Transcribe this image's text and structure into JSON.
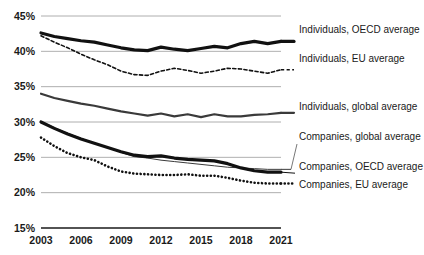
{
  "chart_data": {
    "type": "line",
    "title": "",
    "subtitle": "",
    "xlabel": "",
    "ylabel": "",
    "xlim": [
      2003,
      2021
    ],
    "ylim": [
      15,
      45
    ],
    "grid": true,
    "legend_position": "right",
    "y_ticks": [
      "45%",
      "40%",
      "35%",
      "30%",
      "25%",
      "20%",
      "15%"
    ],
    "y_tick_values": [
      45,
      40,
      35,
      30,
      25,
      20,
      15
    ],
    "x_ticks": [
      "2003",
      "2006",
      "2009",
      "2012",
      "2015",
      "2018",
      "2021"
    ],
    "x_tick_values": [
      2003,
      2006,
      2009,
      2012,
      2015,
      2018,
      2021
    ],
    "x": [
      2003,
      2004,
      2005,
      2006,
      2007,
      2008,
      2009,
      2010,
      2011,
      2012,
      2013,
      2014,
      2015,
      2016,
      2017,
      2018,
      2019,
      2020,
      2021
    ],
    "series": [
      {
        "name": "Individuals, OECD average",
        "style": "thick-solid",
        "color": "#111111",
        "width": 3.2,
        "values": [
          42.6,
          42.1,
          41.8,
          41.5,
          41.3,
          40.9,
          40.5,
          40.2,
          40.1,
          40.6,
          40.3,
          40.1,
          40.4,
          40.7,
          40.5,
          41.1,
          41.4,
          41.1,
          41.4
        ]
      },
      {
        "name": "Individuals, EU average",
        "style": "dashed",
        "color": "#111111",
        "width": 1.6,
        "values": [
          42.2,
          41.3,
          40.5,
          39.6,
          38.8,
          38.1,
          37.2,
          36.7,
          36.6,
          37.2,
          37.6,
          37.3,
          36.9,
          37.2,
          37.6,
          37.5,
          37.2,
          36.9,
          37.4
        ]
      },
      {
        "name": "Individuals, global average",
        "style": "medium-solid",
        "color": "#3a3a3a",
        "width": 2.2,
        "values": [
          34.0,
          33.4,
          33.0,
          32.6,
          32.3,
          31.9,
          31.5,
          31.2,
          30.9,
          31.2,
          30.8,
          31.1,
          30.7,
          31.1,
          30.8,
          30.8,
          31.0,
          31.1,
          31.3
        ]
      },
      {
        "name": "Companies, global average",
        "style": "thin-solid",
        "color": "#3a3a3a",
        "width": 1.0,
        "values": [
          30.1,
          29.2,
          28.4,
          27.7,
          27.0,
          26.4,
          25.7,
          25.1,
          24.9,
          24.6,
          24.4,
          24.2,
          24.0,
          23.8,
          23.6,
          23.5,
          23.4,
          23.3,
          23.3
        ]
      },
      {
        "name": "Companies, OECD average",
        "style": "thick-solid",
        "color": "#111111",
        "width": 3.2,
        "values": [
          30.0,
          29.1,
          28.3,
          27.6,
          27.0,
          26.4,
          25.8,
          25.3,
          25.1,
          25.2,
          24.9,
          24.7,
          24.6,
          24.5,
          24.1,
          23.5,
          23.1,
          22.9,
          22.9
        ]
      },
      {
        "name": "Companies, EU average",
        "style": "dotted",
        "color": "#111111",
        "width": 2.6,
        "values": [
          27.8,
          26.6,
          25.6,
          25.0,
          24.6,
          23.7,
          23.0,
          22.7,
          22.6,
          22.5,
          22.5,
          22.6,
          22.4,
          22.4,
          22.1,
          21.7,
          21.4,
          21.3,
          21.3
        ]
      }
    ],
    "legend_entries": [
      {
        "label": "Individuals, OECD average",
        "y": 33,
        "swatch": false
      },
      {
        "label": "Individuals, EU average",
        "y": 62,
        "swatch": false
      },
      {
        "label": "Individuals, global average",
        "y": 110,
        "swatch": false
      },
      {
        "label": "Companies, global average",
        "y": 140,
        "swatch": false
      },
      {
        "label": "Companies, OECD average",
        "y": 170,
        "swatch": false
      },
      {
        "label": "Companies, EU average",
        "y": 188,
        "swatch": false
      }
    ]
  }
}
